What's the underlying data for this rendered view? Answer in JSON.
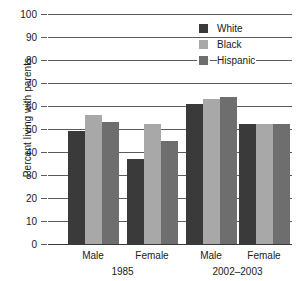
{
  "chart_data": {
    "type": "bar",
    "title": "",
    "xlabel": "",
    "ylabel": "Percent living with parents",
    "ylim": [
      0,
      100
    ],
    "yticks": [
      0,
      10,
      20,
      30,
      40,
      50,
      60,
      70,
      80,
      90,
      100
    ],
    "ytick_labels": [
      "0",
      "10",
      "20",
      "30",
      "40",
      "50",
      "60",
      "70",
      "80",
      "90",
      "100"
    ],
    "grid": true,
    "legend_position": "top-right",
    "categories": [
      "Male",
      "Female",
      "Male",
      "Female"
    ],
    "groups": [
      {
        "label": "1985",
        "categories": [
          "Male",
          "Female"
        ]
      },
      {
        "label": "2002–2003",
        "categories": [
          "Male",
          "Female"
        ]
      }
    ],
    "series": [
      {
        "name": "White",
        "color": "#3a3a3a",
        "values": [
          49,
          37,
          61,
          52
        ]
      },
      {
        "name": "Black",
        "color": "#a8a8a8",
        "values": [
          56,
          52,
          63,
          52
        ]
      },
      {
        "name": "Hispanic",
        "color": "#6e6e6e",
        "values": [
          53,
          45,
          64,
          52
        ]
      }
    ]
  },
  "legend": {
    "items": [
      {
        "label": "White",
        "color": "#3a3a3a"
      },
      {
        "label": "Black",
        "color": "#a8a8a8"
      },
      {
        "label": "Hispanic",
        "color": "#6e6e6e"
      }
    ]
  },
  "axis": {
    "y_title": "Percent living with parents"
  }
}
